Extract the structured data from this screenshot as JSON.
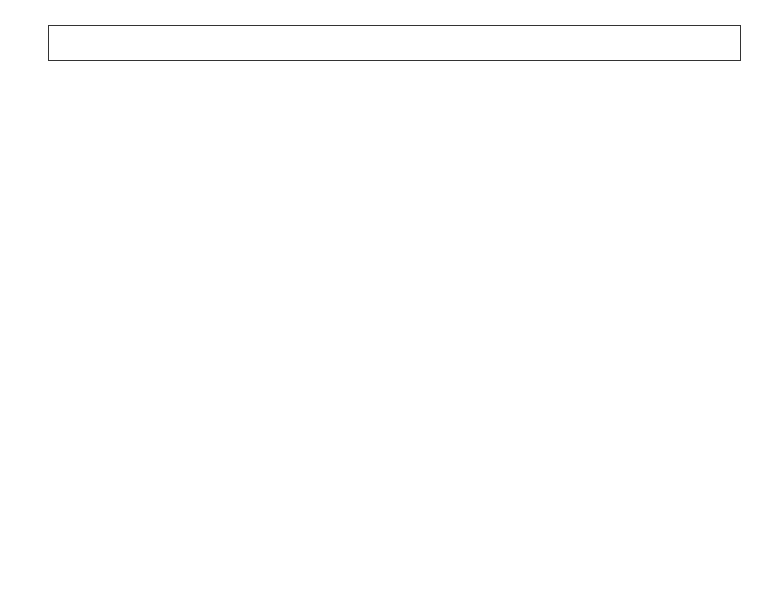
{
  "legend": {
    "items": [
      {
        "label": "Submarines",
        "color": "#2e2e2e",
        "col": 0,
        "row": 0
      },
      {
        "label": "Amphibious Ships",
        "color": "#ffffff",
        "col": 1,
        "row": 0
      },
      {
        "label": "Support Ships",
        "color": "#474747",
        "col": 2,
        "row": 0
      },
      {
        "label": "Frigates",
        "color": "#bdbdbd",
        "col": 3,
        "row": 0
      },
      {
        "label": "DDG-51",
        "color": "#3a3a3a",
        "col": 0,
        "row": 1
      },
      {
        "label": "DDG-1000",
        "color": "#ffffff",
        "col": 1,
        "row": 1
      },
      {
        "label": "CG-47",
        "color": "#6e6e6e",
        "col": 2,
        "row": 1
      },
      {
        "label": "CG(X)",
        "color": "#9a9a9a",
        "col": 3,
        "row": 1
      }
    ]
  },
  "top_panel": {
    "title": "Number of Ships",
    "phase_labels": [
      "Actual",
      "FYDP",
      "CBO Projection"
    ],
    "steady_state_label": "Steady State",
    "y_ticks": [
      "0",
      "5",
      "10",
      "15",
      "20",
      "25"
    ]
  },
  "bottom_panel": {
    "title": "Billions of 2008 Dollars",
    "navy_estimate_label": "Navy Estimate",
    "cbo_estimate_label": "CBO Estimate",
    "steady_state_label": "Steady State",
    "y_ticks": [
      "0",
      "10",
      "20",
      "30"
    ],
    "x_ticks": [
      "1980",
      "1984",
      "1988",
      "1992",
      "1996",
      "2000",
      "2004",
      "2008",
      "2012",
      "2016",
      "2020",
      "2024"
    ]
  },
  "chart_data": [
    {
      "type": "bar",
      "title": "Number of Ships",
      "stacked": true,
      "xlabel": "",
      "ylabel": "Number of Ships",
      "ylim": [
        0,
        25
      ],
      "y_axis_position": "right",
      "categories": [
        1980,
        1981,
        1982,
        1983,
        1984,
        1985,
        1986,
        1987,
        1988,
        1989,
        1990,
        1991,
        1992,
        1993,
        1994,
        1995,
        1996,
        1997,
        1998,
        1999,
        2000,
        2001,
        2002,
        2003,
        2004,
        2005,
        2006,
        2007,
        2008,
        2009,
        2010,
        2011,
        2012,
        2013,
        2014,
        2015,
        2016,
        2017,
        2018,
        2019,
        2020,
        2021,
        2022,
        2023,
        2024,
        2025
      ],
      "series": [
        {
          "name": "Submarines",
          "values": [
            3,
            2.5,
            2,
            3,
            4,
            4,
            4,
            4,
            3,
            3,
            3,
            2,
            2,
            2,
            1,
            1,
            1,
            1,
            1,
            1,
            1,
            1,
            1,
            1,
            1,
            1,
            1,
            1,
            1,
            1,
            1,
            1,
            2,
            2,
            2,
            2,
            2,
            2,
            2,
            2,
            2,
            2,
            3,
            3,
            3,
            3
          ]
        },
        {
          "name": "Amphibious Ships",
          "values": [
            0,
            1,
            1,
            1,
            0,
            0,
            0,
            0,
            0,
            0,
            0,
            1,
            2,
            0,
            1,
            1,
            0,
            2,
            0,
            1,
            0,
            1,
            1,
            0,
            1,
            1,
            1,
            0,
            1,
            1.5,
            3,
            3,
            1,
            2,
            0,
            0,
            0,
            1,
            1,
            0,
            1,
            1,
            1,
            2,
            1,
            1
          ]
        },
        {
          "name": "Support Ships",
          "values": [
            1,
            1,
            0,
            1,
            2,
            2,
            3,
            0,
            2,
            1,
            0,
            0,
            0,
            0,
            0,
            0,
            0,
            0,
            0,
            0,
            1,
            0,
            0,
            0,
            0,
            0,
            0,
            0,
            0,
            0,
            0,
            0,
            0,
            0,
            0,
            0,
            0,
            0,
            0,
            0,
            0,
            0,
            0,
            0,
            0,
            0
          ]
        },
        {
          "name": "DDG-51",
          "values": [
            0,
            5,
            11.5,
            5,
            11,
            14,
            9,
            12,
            4,
            14,
            14,
            6.5,
            5.5,
            10.5,
            3.5,
            3.5,
            4.5,
            2.5,
            3.5,
            3.5,
            3.5,
            3.5,
            3.5,
            4.5,
            5.5,
            5.5,
            1,
            1,
            1,
            1,
            1,
            2,
            3,
            3,
            1,
            2,
            1,
            1,
            1,
            0,
            4,
            2,
            4,
            5,
            4,
            4
          ]
        },
        {
          "name": "DDG-1000",
          "values": [
            0,
            0,
            0,
            0,
            0,
            0,
            0,
            0,
            0,
            0,
            0,
            0,
            0,
            0,
            0,
            0,
            0,
            0,
            0,
            0,
            0,
            0,
            0,
            0,
            0,
            0,
            0,
            3.5,
            0,
            1,
            0.7,
            1,
            1,
            1,
            0,
            0,
            0,
            0,
            0,
            0,
            0,
            0,
            0,
            0,
            0,
            0
          ]
        },
        {
          "name": "CG-47",
          "values": [
            1,
            2.5,
            3,
            4,
            2,
            1.5,
            0,
            2.5,
            4,
            1.5,
            0,
            0,
            0,
            0,
            0,
            0,
            0.5,
            0,
            0,
            0,
            0,
            0,
            0.5,
            0,
            0,
            0,
            0,
            0,
            0,
            0,
            0,
            0,
            1,
            1,
            0,
            2,
            2,
            0,
            0,
            0,
            0,
            0,
            0.5,
            1,
            0,
            0
          ]
        },
        {
          "name": "Frigates",
          "values": [
            5,
            5,
            3,
            1.5,
            0,
            0,
            0,
            0,
            0,
            0,
            0,
            0,
            0,
            0,
            0,
            0,
            0,
            0,
            0,
            0,
            0,
            0,
            0,
            0,
            0,
            1,
            1.5,
            0,
            2,
            2.5,
            6,
            6,
            6,
            4,
            6,
            6,
            6,
            6,
            0,
            2,
            2,
            2,
            1,
            0,
            1.5,
            1
          ]
        },
        {
          "name": "CG(X)",
          "values": [
            0,
            0,
            0,
            0,
            0,
            0,
            0,
            0,
            0,
            0,
            0,
            0,
            0,
            0,
            0,
            0,
            0,
            0,
            0,
            0,
            0,
            0,
            0,
            0,
            0,
            0,
            0,
            0,
            0,
            0,
            0,
            1,
            0.8,
            0,
            1,
            0,
            1,
            0,
            0,
            0,
            0,
            0,
            0,
            0,
            0,
            0
          ]
        }
      ],
      "totals": [
        10.5,
        17.5,
        20.5,
        14.5,
        19.5,
        21.5,
        16,
        18.5,
        14.5,
        19.5,
        17.5,
        9.5,
        9.5,
        12.5,
        5.5,
        5.5,
        5.5,
        5.5,
        4.5,
        5.5,
        5.5,
        5.5,
        5.5,
        6.5,
        7.5,
        8.5,
        4.5,
        6.5,
        5.5,
        7.5,
        12,
        14,
        14,
        13,
        10,
        12,
        12,
        12,
        6,
        5,
        9,
        8,
        10,
        10,
        10,
        11
      ],
      "annotations": [
        {
          "text": "Actual",
          "x": 2004
        },
        {
          "text": "FYDP",
          "x": 2009
        },
        {
          "text": "CBO Projection",
          "x": 2016
        },
        {
          "text": "Steady State",
          "range": [
            8.2,
            11.2
          ]
        }
      ],
      "phase_dividers": [
        2007.5,
        2013
      ],
      "grid": false
    },
    {
      "type": "area",
      "title": "Billions of 2008 Dollars",
      "stacked": true,
      "xlabel": "",
      "ylabel": "Billions of 2008 Dollars",
      "ylim": [
        0,
        30
      ],
      "x": [
        1980,
        1981,
        1982,
        1983,
        1984,
        1985,
        1986,
        1987,
        1988,
        1989,
        1990,
        1991,
        1992,
        1993,
        1994,
        1995,
        1996,
        1997,
        1998,
        1999,
        2000,
        2001,
        2002,
        2003,
        2004,
        2005,
        2006,
        2007,
        2008,
        2009,
        2010,
        2011,
        2012,
        2013,
        2014,
        2015,
        2016,
        2017,
        2018,
        2019,
        2020,
        2021,
        2022,
        2023,
        2024,
        2025
      ],
      "series": [
        {
          "name": "Submarines",
          "values": [
            4.5,
            4.3,
            3.5,
            5.2,
            6,
            6.5,
            5.8,
            6.2,
            5.2,
            6.8,
            4,
            4.5,
            2.8,
            1.5,
            1,
            0.3,
            2,
            1.5,
            3.2,
            2.2,
            1.2,
            2.5,
            3.5,
            4,
            4.5,
            3.8,
            3.3,
            3.3,
            2.9,
            3.4,
            3.8,
            3.8,
            4.3,
            4.4,
            4.9,
            5.2,
            5,
            4.3,
            4,
            7,
            6.6,
            5,
            8.2,
            6.6,
            8.2,
            8
          ]
        },
        {
          "name": "Amphibious Ships",
          "values": [
            0.3,
            0.5,
            0.5,
            0.8,
            2.5,
            0.7,
            1.5,
            0,
            1,
            0.6,
            0,
            1.8,
            0.3,
            0.2,
            0,
            0.2,
            2.5,
            0,
            0,
            1,
            2,
            1.5,
            1,
            1.2,
            1.5,
            1.3,
            0.8,
            0.8,
            2,
            1.3,
            1.7,
            2.3,
            1.2,
            2.5,
            0.8,
            1.2,
            0,
            2,
            3.8,
            0.2,
            1,
            1,
            1.2,
            1,
            1.5,
            1.5
          ]
        },
        {
          "name": "Support Ships",
          "values": [
            0.3,
            0.7,
            1,
            1.2,
            1,
            1,
            1,
            0,
            0,
            1.5,
            1.5,
            0,
            0,
            0,
            0,
            0,
            0,
            0,
            0,
            0,
            0,
            0,
            0,
            0,
            0,
            0,
            0,
            0,
            0.5,
            0.3,
            0.3,
            0.5,
            0.8,
            0.3,
            1,
            0.8,
            0,
            0,
            0,
            0.3,
            0.3,
            0.5,
            0.5,
            0.5,
            0.8,
            0.8
          ]
        },
        {
          "name": "DDG-51",
          "values": [
            0,
            0.5,
            1.5,
            2.5,
            1.5,
            2.5,
            0.8,
            5.5,
            0.5,
            1,
            5.5,
            4.5,
            7,
            6.5,
            4,
            3.2,
            2.5,
            4.3,
            4.5,
            3.8,
            3.8,
            4,
            4.5,
            4.5,
            6,
            4.5,
            1.3,
            1.3,
            0.5,
            0.5,
            0.2,
            1,
            0,
            0.3,
            0,
            0,
            0,
            0,
            0,
            0,
            0.5,
            0,
            0.5,
            0.5,
            0.5,
            0.5
          ]
        },
        {
          "name": "DDG-1000",
          "values": [
            0,
            0,
            0,
            0,
            0,
            0,
            0,
            0,
            0,
            0,
            0,
            0,
            0,
            0,
            0,
            0,
            0,
            0,
            0,
            0,
            0,
            0,
            0,
            0,
            0,
            0,
            0.3,
            0.5,
            0.8,
            0.3,
            0.3,
            0,
            0,
            0,
            0,
            0,
            0,
            0,
            0,
            0,
            0,
            0,
            0,
            0,
            0,
            3.3
          ]
        },
        {
          "name": "CG-47",
          "values": [
            2,
            2.5,
            1.2,
            0.2,
            0,
            0,
            0,
            0,
            0,
            0,
            0,
            0,
            0,
            0,
            0,
            0,
            0,
            0,
            0,
            0,
            0,
            0,
            0,
            0,
            0,
            0,
            0,
            0,
            0,
            0,
            0,
            0,
            0,
            0,
            0,
            0,
            0,
            0,
            0,
            0,
            0,
            0,
            0,
            0,
            0,
            0
          ]
        },
        {
          "name": "Frigates",
          "values": [
            0,
            0,
            0,
            0,
            0,
            0,
            0,
            0,
            0,
            0,
            0,
            0,
            0,
            0,
            0,
            0,
            0,
            0,
            0,
            0,
            0,
            0,
            0,
            0,
            0,
            0,
            0,
            0,
            0,
            0.5,
            1.5,
            4.5,
            1.5,
            2.5,
            4.5,
            6.5,
            4.5,
            6,
            6,
            7.5,
            7.5,
            7.5,
            5,
            5.5,
            5.5,
            4.5
          ]
        },
        {
          "name": "CG(X)",
          "values": [
            0,
            0,
            0,
            0,
            0,
            0,
            0,
            0,
            0,
            0,
            0,
            0,
            0,
            0,
            0,
            0,
            0,
            0,
            0,
            0,
            0,
            0,
            0,
            0,
            0,
            0,
            0,
            0,
            0,
            0,
            0.2,
            1,
            1.5,
            1,
            1.5,
            0.5,
            2.5,
            1,
            0.5,
            1,
            1,
            2,
            1.5,
            0.5,
            3,
            5
          ]
        },
        {
          "name": "Other (shipbuilding misc.)",
          "values": [
            5.9,
            3.5,
            5.3,
            10.6,
            5,
            4.3,
            3.9,
            4.3,
            15.6,
            4.6,
            0.5,
            0.7,
            1.9,
            0.8,
            0,
            3.8,
            2.5,
            0.2,
            0.3,
            0,
            0.8,
            4,
            0,
            0.3,
            0,
            1,
            0.3,
            0.2,
            3.3,
            4.5,
            4.5,
            3.9,
            6.7,
            5.5,
            4.8,
            4.8,
            5.3,
            7.2,
            4.3,
            3,
            4.1,
            5.5,
            7.1,
            11.4,
            6.5,
            6.4
          ]
        }
      ],
      "navy_estimate_total": [
        13,
        12,
        13,
        20.5,
        16,
        15,
        13,
        16,
        22.3,
        14.5,
        11.5,
        11.5,
        12,
        9,
        5,
        7.5,
        7.5,
        6,
        8,
        7,
        8,
        12,
        9,
        10,
        12,
        11,
        6,
        6.3,
        8.5,
        9.8,
        10.5,
        13,
        13,
        12.5,
        13,
        13.5,
        14,
        16,
        13.5,
        15,
        16,
        17.5,
        18.5,
        15,
        19,
        24
      ],
      "cbo_estimate_total": [
        13,
        12,
        13,
        20.5,
        16,
        15,
        13,
        16,
        22.3,
        14.5,
        11.5,
        11.5,
        12,
        9,
        5,
        7.5,
        7.5,
        6,
        8,
        7,
        8,
        12,
        9,
        10,
        12,
        11,
        7,
        7,
        11,
        13,
        13,
        17,
        18,
        19,
        17.5,
        19,
        20,
        22,
        18.5,
        19,
        21,
        23,
        26,
        26,
        27,
        30
      ],
      "annotations": [
        {
          "text": "Navy Estimate",
          "x": 2003
        },
        {
          "text": "CBO Estimate",
          "x": 2018
        },
        {
          "text": "Steady State",
          "range": [
            13.5,
            18.5
          ]
        }
      ],
      "phase_dividers": [
        2008,
        2013
      ],
      "grid": false
    }
  ]
}
